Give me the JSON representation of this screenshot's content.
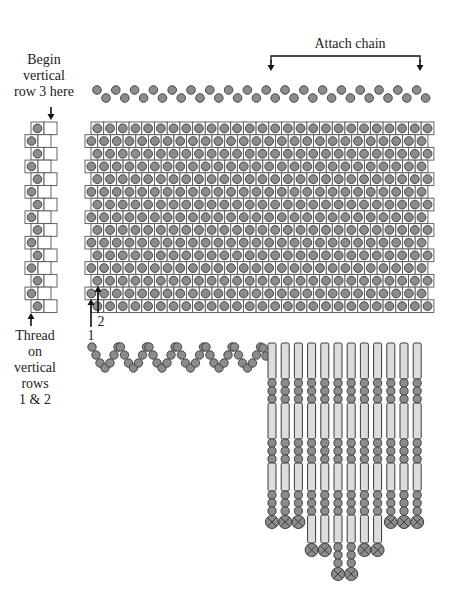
{
  "labels": {
    "begin_row3": [
      "Begin",
      "vertical",
      "row 3 here"
    ],
    "attach_chain": "Attach chain",
    "thread_on": [
      "Thread",
      "on",
      "vertical",
      "rows",
      "1 & 2"
    ],
    "marker_1": "1",
    "marker_2": "2"
  },
  "colors": {
    "bead_fill": "#8c8c8c",
    "bead_stroke": "#3a3a3a",
    "cell_stroke": "#555555",
    "bugle_fill": "#dcdcdc",
    "line": "#111111"
  },
  "diagram": {
    "top_chain": {
      "rows": 2,
      "beads_per_row": [
        18,
        18
      ]
    },
    "grid": {
      "rows": 17,
      "cell_size": 12.7,
      "even_row_x": 91,
      "odd_row_x": 85,
      "top_y": 122
    },
    "left_strip": {
      "cells": 15
    },
    "wavy_chain": {
      "waves": 6
    },
    "fringe": {
      "strand_count": 12,
      "strand_lengths": [
        "short",
        "short",
        "short",
        "medium",
        "medium",
        "long",
        "long",
        "medium",
        "medium",
        "short",
        "short",
        "short"
      ]
    }
  }
}
